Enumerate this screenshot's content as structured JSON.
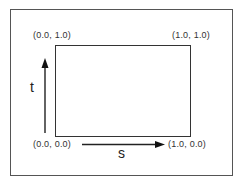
{
  "diagram": {
    "corners": {
      "top_left": "(0.0, 1.0)",
      "top_right": "(1.0, 1.0)",
      "bottom_left": "(0.0, 0.0)",
      "bottom_right": "(1.0, 0.0)"
    },
    "axes": {
      "vertical_label": "t",
      "horizontal_label": "s"
    },
    "colors": {
      "line": "#333333",
      "frame": "#555555",
      "background": "#ffffff"
    }
  }
}
